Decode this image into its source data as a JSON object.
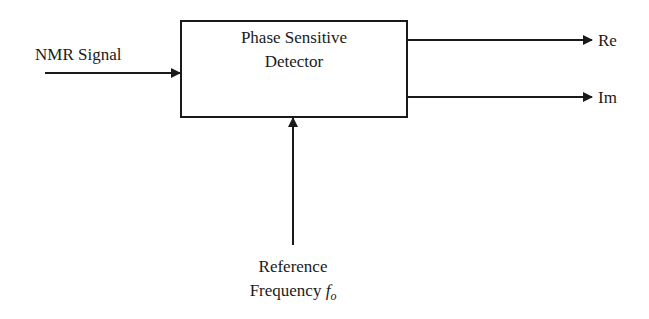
{
  "diagram": {
    "type": "block-diagram",
    "block": {
      "line1": "Phase Sensitive",
      "line2": "Detector"
    },
    "input": {
      "label": "NMR Signal"
    },
    "outputs": [
      {
        "label": "Re"
      },
      {
        "label": "Im"
      }
    ],
    "reference": {
      "line1": "Reference",
      "line2_text": "Frequency ",
      "symbol": "f",
      "subscript": "o"
    },
    "colors": {
      "stroke": "#1a1a1a",
      "background": "#ffffff"
    }
  }
}
